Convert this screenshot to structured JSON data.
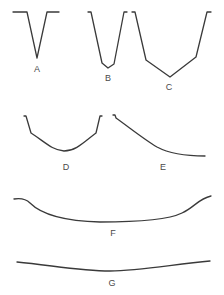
{
  "diagram": {
    "line_color": "#3a3a3a",
    "profiles": [
      {
        "label": "A",
        "shape": "sharp V-shaped valley",
        "path": "M13,12 L27,12 L37,58 L47,12 L59,12",
        "label_pos": [
          37,
          72
        ]
      },
      {
        "label": "B",
        "shape": "narrow V with small floor",
        "path": "M88,12 L91,12 L102,63 L108,68 L114,64 L124,12 L127,12",
        "label_pos": [
          108,
          81
        ]
      },
      {
        "label": "C",
        "shape": "wide V with broad sloping floor",
        "path": "M132,12 L135,12 L146,60 L170,77 L196,57 L207,12 L211,12",
        "label_pos": [
          169,
          90
        ]
      },
      {
        "label": "D",
        "shape": "open U-shaped valley",
        "path": "M24,116 L26,116 L31,133 C45,142 52,150 64,151 C76,151 84,142 96,133 L100,116 L102,116",
        "label_pos": [
          66,
          170
        ]
      },
      {
        "label": "E",
        "shape": "single sloping side curving to floor",
        "path": "M113,115 L115,115 L116,118 C130,128 145,140 157,147 C170,154 185,156 205,156",
        "label_pos": [
          163,
          170
        ]
      },
      {
        "label": "F",
        "shape": "broad shallow basin with steep edges",
        "path": "M14,199 C20,198 25,198 30,203 C40,213 60,221 100,222 C140,222 170,219 182,213 C195,207 198,199 211,196",
        "label_pos": [
          113,
          236
        ]
      },
      {
        "label": "G",
        "shape": "very broad gentle plain",
        "path": "M17,262 C50,265 80,271 110,271 C140,271 175,264 210,261",
        "label_pos": [
          112,
          286
        ]
      }
    ]
  }
}
